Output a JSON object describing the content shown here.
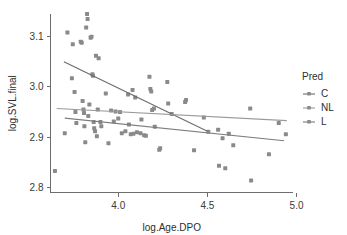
{
  "chart_data": {
    "type": "scatter",
    "title": "",
    "xlabel": "log.Age.DPO",
    "ylabel": "log.SVL.final",
    "xlim": [
      3.62,
      4.98
    ],
    "ylim": [
      2.79,
      3.145
    ],
    "xticks": [
      4.0,
      4.5,
      5.0
    ],
    "xticklabels": [
      "4.0",
      "4.5",
      "5.0"
    ],
    "yticks": [
      2.8,
      2.9,
      3.0,
      3.1
    ],
    "yticklabels": [
      "2.8",
      "2.9",
      "3.0",
      "3.1"
    ],
    "grid": false,
    "legend": {
      "title": "Pred",
      "position": "right",
      "entries": [
        {
          "label": "C",
          "color": "#6b6b6b"
        },
        {
          "label": "NL",
          "color": "#9a9a9a"
        },
        {
          "label": "L",
          "color": "#7d7d7d"
        }
      ]
    },
    "point_color": "#8a8a8a",
    "point_size": 2.0,
    "series": [
      {
        "name": "C",
        "color": "#6b6b6b",
        "fit_line": {
          "x0": 3.695,
          "y0": 3.05,
          "x1": 4.5,
          "y1": 2.912
        }
      },
      {
        "name": "NL",
        "color": "#9a9a9a",
        "fit_line": {
          "x0": 3.655,
          "y0": 2.957,
          "x1": 4.945,
          "y1": 2.933
        }
      },
      {
        "name": "L",
        "color": "#7d7d7d",
        "fit_line": {
          "x0": 3.7,
          "y0": 2.938,
          "x1": 4.93,
          "y1": 2.893
        }
      }
    ],
    "points": [
      {
        "x": 3.645,
        "y": 2.833
      },
      {
        "x": 3.7,
        "y": 2.908
      },
      {
        "x": 3.715,
        "y": 3.108
      },
      {
        "x": 3.74,
        "y": 3.017
      },
      {
        "x": 3.745,
        "y": 3.085
      },
      {
        "x": 3.755,
        "y": 2.99
      },
      {
        "x": 3.76,
        "y": 2.95
      },
      {
        "x": 3.765,
        "y": 2.928
      },
      {
        "x": 3.79,
        "y": 3.09
      },
      {
        "x": 3.795,
        "y": 3.088
      },
      {
        "x": 3.8,
        "y": 2.972
      },
      {
        "x": 3.805,
        "y": 2.955
      },
      {
        "x": 3.808,
        "y": 2.948
      },
      {
        "x": 3.81,
        "y": 2.922
      },
      {
        "x": 3.815,
        "y": 2.89
      },
      {
        "x": 3.82,
        "y": 3.118
      },
      {
        "x": 3.825,
        "y": 3.145
      },
      {
        "x": 3.828,
        "y": 3.135
      },
      {
        "x": 3.832,
        "y": 2.942
      },
      {
        "x": 3.838,
        "y": 2.965
      },
      {
        "x": 3.845,
        "y": 3.098
      },
      {
        "x": 3.85,
        "y": 3.1
      },
      {
        "x": 3.855,
        "y": 3.025
      },
      {
        "x": 3.858,
        "y": 3.022
      },
      {
        "x": 3.862,
        "y": 2.93
      },
      {
        "x": 3.865,
        "y": 2.918
      },
      {
        "x": 3.87,
        "y": 2.912
      },
      {
        "x": 3.875,
        "y": 3.062
      },
      {
        "x": 3.88,
        "y": 2.902
      },
      {
        "x": 3.885,
        "y": 2.955
      },
      {
        "x": 3.89,
        "y": 3.057
      },
      {
        "x": 3.9,
        "y": 2.93
      },
      {
        "x": 3.905,
        "y": 2.922
      },
      {
        "x": 3.93,
        "y": 2.987
      },
      {
        "x": 3.945,
        "y": 2.888
      },
      {
        "x": 3.96,
        "y": 2.953
      },
      {
        "x": 3.975,
        "y": 2.931
      },
      {
        "x": 3.985,
        "y": 2.951
      },
      {
        "x": 4.0,
        "y": 2.937
      },
      {
        "x": 4.01,
        "y": 2.95
      },
      {
        "x": 4.02,
        "y": 2.908
      },
      {
        "x": 4.04,
        "y": 2.912
      },
      {
        "x": 4.055,
        "y": 2.985
      },
      {
        "x": 4.06,
        "y": 2.925
      },
      {
        "x": 4.07,
        "y": 2.906
      },
      {
        "x": 4.08,
        "y": 2.994
      },
      {
        "x": 4.085,
        "y": 2.907
      },
      {
        "x": 4.095,
        "y": 2.979
      },
      {
        "x": 4.105,
        "y": 2.91
      },
      {
        "x": 4.125,
        "y": 2.908
      },
      {
        "x": 4.13,
        "y": 2.935
      },
      {
        "x": 4.145,
        "y": 2.904
      },
      {
        "x": 4.155,
        "y": 2.903
      },
      {
        "x": 4.175,
        "y": 3.02
      },
      {
        "x": 4.18,
        "y": 2.996
      },
      {
        "x": 4.185,
        "y": 2.991
      },
      {
        "x": 4.19,
        "y": 2.954
      },
      {
        "x": 4.2,
        "y": 2.957
      },
      {
        "x": 4.205,
        "y": 2.921
      },
      {
        "x": 4.23,
        "y": 2.875
      },
      {
        "x": 4.235,
        "y": 2.878
      },
      {
        "x": 4.275,
        "y": 3.01
      },
      {
        "x": 4.28,
        "y": 2.967
      },
      {
        "x": 4.3,
        "y": 2.946
      },
      {
        "x": 4.375,
        "y": 2.97
      },
      {
        "x": 4.38,
        "y": 2.974
      },
      {
        "x": 4.425,
        "y": 2.874
      },
      {
        "x": 4.48,
        "y": 2.939
      },
      {
        "x": 4.505,
        "y": 2.911
      },
      {
        "x": 4.56,
        "y": 2.915
      },
      {
        "x": 4.565,
        "y": 2.843
      },
      {
        "x": 4.585,
        "y": 2.898
      },
      {
        "x": 4.6,
        "y": 2.838
      },
      {
        "x": 4.62,
        "y": 2.907
      },
      {
        "x": 4.645,
        "y": 2.884
      },
      {
        "x": 4.74,
        "y": 2.957
      },
      {
        "x": 4.745,
        "y": 2.814
      },
      {
        "x": 4.845,
        "y": 2.866
      },
      {
        "x": 4.9,
        "y": 2.928
      },
      {
        "x": 4.94,
        "y": 2.906
      }
    ]
  }
}
